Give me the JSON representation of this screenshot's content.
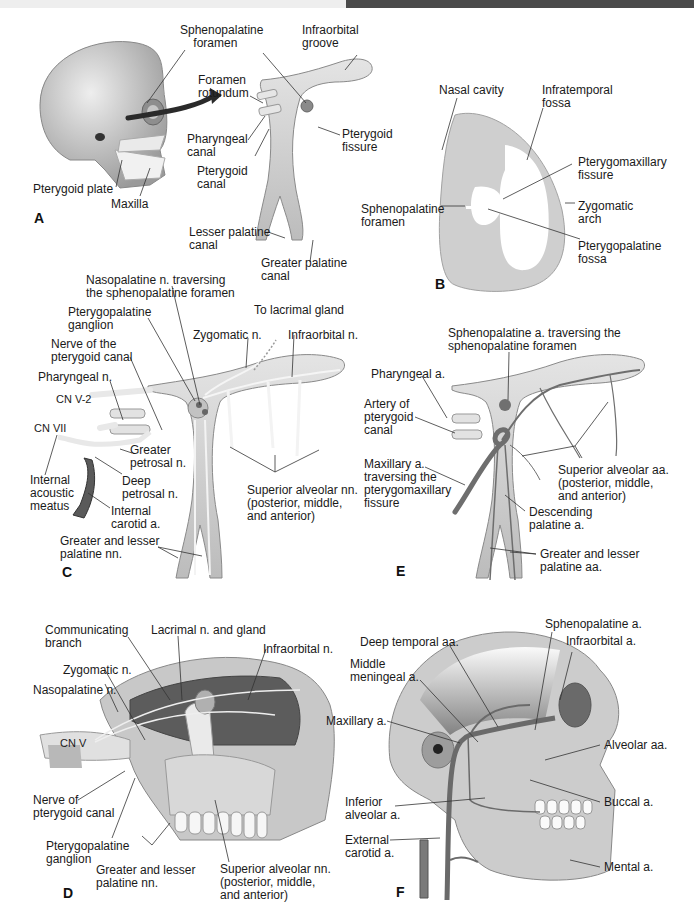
{
  "figure": {
    "panels": {
      "A": {
        "letter": "A",
        "labels": {
          "sphenopalatine_foramen": "Sphenopalatine\n    foramen",
          "infraorbital_groove": "Infraorbital\ngroove",
          "foramen_rotundum": "Foramen\nrotundum",
          "pharyngeal_canal": "Pharyngeal\ncanal",
          "pterygoid_canal": "Pterygoid\ncanal",
          "pterygoid_fissure": "Pterygoid\nfissure",
          "pterygoid_plate": "Pterygoid plate",
          "maxilla": "Maxilla",
          "lesser_palatine_canal": "Lesser palatine\ncanal",
          "greater_palatine_canal": "Greater palatine\ncanal"
        }
      },
      "B": {
        "letter": "B",
        "labels": {
          "nasal_cavity": "Nasal cavity",
          "infratemporal_fossa": "Infratemporal\nfossa",
          "pterygomaxillary_fissure": "Pterygomaxillary\nfissure",
          "sphenopalatine_foramen": "Sphenopalatine\nforamen",
          "zygomatic_arch": "Zygomatic\narch",
          "pterygopalatine_fossa": "Pterygopalatine\nfossa"
        }
      },
      "C": {
        "letter": "C",
        "labels": {
          "nasopalatine_n": "Nasopalatine n. traversing\nthe sphenopalatine foramen",
          "pterygopalatine_ganglion": "Pterygopalatine\nganglion",
          "to_lacrimal_gland": "To lacrimal gland",
          "zygomatic_n": "Zygomatic n.",
          "infraorbital_n": "Infraorbital n.",
          "nerve_pterygoid_canal": "Nerve of the\npterygoid canal",
          "pharyngeal_n": "Pharyngeal n.",
          "cn_v2": "CN V-2",
          "cn_vii": "CN VII",
          "greater_petrosal_n": "Greater\npetrosal n.",
          "deep_petrosal_n": "Deep\npetrosal n.",
          "internal_acoustic_meatus": "Internal\nacoustic\nmeatus",
          "internal_carotid_a": "Internal\ncarotid a.",
          "superior_alveolar_nn": "Superior alveolar nn.\n(posterior, middle,\nand anterior)",
          "greater_lesser_palatine_nn": "Greater and lesser\npalatine nn."
        }
      },
      "D": {
        "letter": "D",
        "labels": {
          "communicating_branch": "Communicating\nbranch",
          "lacrimal_n_gland": "Lacrimal n. and gland",
          "infraorbital_n": "Infraorbital n.",
          "zygomatic_n": "Zygomatic n.",
          "nasopalatine_n": "Nasopalatine n.",
          "cn_v": "CN V",
          "nerve_pterygoid_canal": "Nerve of\npterygoid canal",
          "pterygopalatine_ganglion": "Pterygopalatine\nganglion",
          "greater_lesser_palatine_nn": "Greater and lesser\npalatine nn.",
          "superior_alveolar_nn": "Superior alveolar nn.\n(posterior, middle,\nand anterior)"
        }
      },
      "E": {
        "letter": "E",
        "labels": {
          "sphenopalatine_a": "Sphenopalatine a. traversing the\nsphenopalatine foramen",
          "pharyngeal_a": "Pharyngeal a.",
          "artery_pterygoid_canal": "Artery of\npterygoid\ncanal",
          "maxillary_a": "Maxillary a.\ntraversing the\npterygomaxillary\nfissure",
          "superior_alveolar_aa": "Superior alveolar aa.\n(posterior, middle,\nand anterior)",
          "descending_palatine_a": "Descending\npalatine a.",
          "greater_lesser_palatine_aa": "Greater and lesser\npalatine aa."
        }
      },
      "F": {
        "letter": "F",
        "labels": {
          "sphenopalatine_a": "Sphenopalatine a.",
          "deep_temporal_aa": "Deep temporal aa.",
          "infraorbital_a": "Infraorbital a.",
          "middle_meningeal_a": "Middle\nmeningeal a.",
          "maxillary_a": "Maxillary a.",
          "alveolar_aa": "Alveolar aa.",
          "inferior_alveolar_a": "Inferior\nalveolar a.",
          "buccal_a": "Buccal a.",
          "external_carotid_a": "External\ncarotid a.",
          "mental_a": "Mental a."
        }
      }
    },
    "colors": {
      "bone": "#d4d4d4",
      "bone_dark": "#a8a8a8",
      "artery": "#6e6e6e",
      "nerve": "#f0f0f0",
      "text": "#1a1a1a",
      "leader": "#333333"
    }
  }
}
